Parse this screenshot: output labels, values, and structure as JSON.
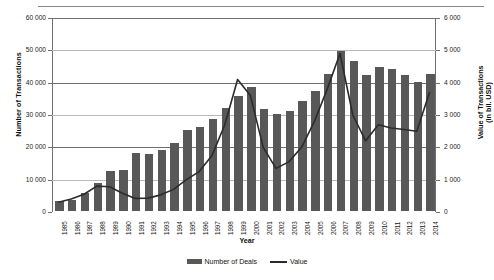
{
  "chart_data": {
    "type": "bar",
    "title": "",
    "xlabel": "Year",
    "ylabel": "Number of Transactions",
    "ylabel_right": "Value of Transactions (in bil. USD)",
    "grid": true,
    "legend_position": "bottom",
    "ylim": [
      0,
      60000
    ],
    "ylim_right": [
      0,
      6000
    ],
    "yticks": [
      "0",
      "10 000",
      "20 000",
      "30 000",
      "40 000",
      "50 000",
      "60 000"
    ],
    "ytick_values": [
      0,
      10000,
      20000,
      30000,
      40000,
      50000,
      60000
    ],
    "yticks_right": [
      "0",
      "1 000",
      "2 000",
      "3 000",
      "4 000",
      "5 000",
      "6 000"
    ],
    "ytick_values_right": [
      0,
      1000,
      2000,
      3000,
      4000,
      5000,
      6000
    ],
    "categories": [
      "1985",
      "1986",
      "1987",
      "1988",
      "1989",
      "1990",
      "1991",
      "1992",
      "1993",
      "1994",
      "1995",
      "1996",
      "1997",
      "1998",
      "1999",
      "2000",
      "2001",
      "2002",
      "2003",
      "2004",
      "2005",
      "2006",
      "2007",
      "2008",
      "2009",
      "2010",
      "2011",
      "2012",
      "2013",
      "2014"
    ],
    "series": [
      {
        "name": "Number of Deals",
        "kind": "bar",
        "axis": "left",
        "color": "#585858",
        "values": [
          3000,
          3500,
          5500,
          8800,
          12500,
          12700,
          18000,
          17500,
          19000,
          21000,
          25000,
          26000,
          28500,
          32000,
          35500,
          38500,
          31500,
          30000,
          31000,
          34000,
          37000,
          42500,
          49500,
          46500,
          42000,
          44500,
          44000,
          42000,
          40000,
          42500
        ]
      },
      {
        "name": "Value",
        "kind": "line",
        "axis": "right",
        "color": "#2b2b2b",
        "values": [
          300,
          400,
          550,
          800,
          780,
          580,
          420,
          430,
          530,
          700,
          1000,
          1250,
          1750,
          2700,
          4100,
          3600,
          2000,
          1350,
          1550,
          2000,
          2800,
          3800,
          4900,
          3000,
          2200,
          2700,
          2600,
          2550,
          2500,
          3700
        ]
      }
    ]
  },
  "legend": {
    "bars_label": "Number of Deals",
    "line_label": "Value"
  },
  "axes": {
    "left_title": "Number of Transactions",
    "right_title_line1": "Value of Transactions",
    "right_title_line2": "(in bil. USD)",
    "x_title": "Year"
  }
}
